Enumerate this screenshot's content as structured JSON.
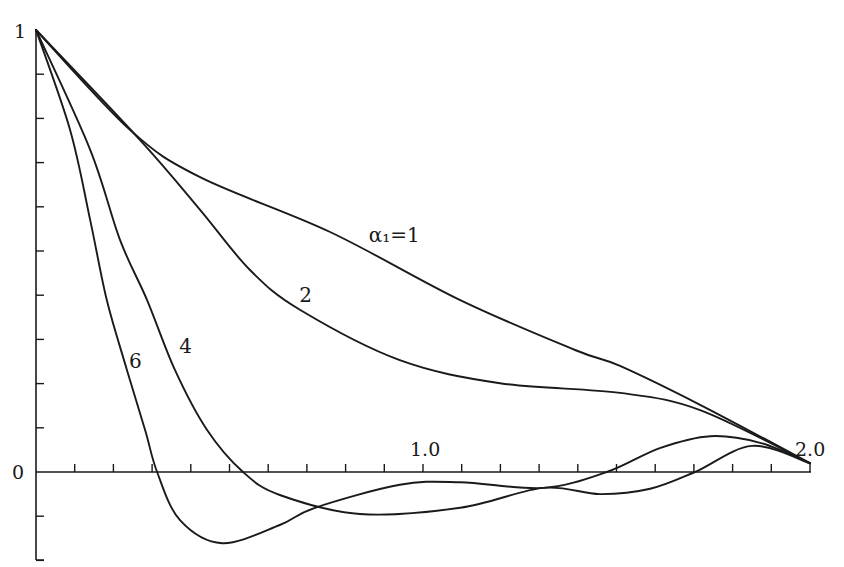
{
  "chart_data": {
    "type": "line",
    "title": "",
    "xlabel": "",
    "ylabel": "",
    "xlim": [
      0,
      2.0
    ],
    "ylim": [
      -0.2,
      1.0
    ],
    "grid": false,
    "legend": "inline curve labels",
    "x_tick_step": 0.1,
    "y_tick_step": 0.1,
    "x_tick_labels": [
      {
        "value": 1.0,
        "text": "1.0"
      },
      {
        "value": 2.0,
        "text": "2.0"
      }
    ],
    "y_tick_labels": [
      {
        "value": 1,
        "text": "1"
      },
      {
        "value": 0,
        "text": "0"
      }
    ],
    "series": [
      {
        "name": "α1=1",
        "label": "α₁=1",
        "label_pos": [
          0.86,
          0.52
        ],
        "points": [
          [
            0,
            1
          ],
          [
            0.243,
            0.774
          ],
          [
            0.424,
            0.667
          ],
          [
            0.76,
            0.543
          ],
          [
            1.096,
            0.389
          ],
          [
            1.393,
            0.276
          ],
          [
            1.509,
            0.24
          ],
          [
            1.716,
            0.152
          ],
          [
            2.0,
            0.02
          ]
        ]
      },
      {
        "name": "α1=2",
        "label": "2",
        "label_pos": [
          0.68,
          0.385
        ],
        "points": [
          [
            0,
            1
          ],
          [
            0.269,
            0.751
          ],
          [
            0.424,
            0.593
          ],
          [
            0.553,
            0.457
          ],
          [
            0.682,
            0.367
          ],
          [
            0.94,
            0.253
          ],
          [
            1.199,
            0.201
          ],
          [
            1.509,
            0.179
          ],
          [
            1.716,
            0.14
          ],
          [
            2.0,
            0.02
          ]
        ]
      },
      {
        "name": "α1=4",
        "label": "4",
        "label_pos": [
          0.37,
          0.27
        ],
        "points": [
          [
            0,
            1
          ],
          [
            0.14,
            0.729
          ],
          [
            0.217,
            0.525
          ],
          [
            0.287,
            0.389
          ],
          [
            0.359,
            0.231
          ],
          [
            0.442,
            0.095
          ],
          [
            0.535,
            0.0
          ],
          [
            0.63,
            -0.052
          ],
          [
            0.837,
            -0.095
          ],
          [
            1.096,
            -0.081
          ],
          [
            1.31,
            -0.036
          ],
          [
            1.457,
            -0.05
          ],
          [
            1.587,
            -0.038
          ],
          [
            1.703,
            0.0
          ],
          [
            1.85,
            0.059
          ],
          [
            2.0,
            0.02
          ]
        ]
      },
      {
        "name": "α1=6",
        "label": "6",
        "label_pos": [
          0.24,
          0.235
        ],
        "points": [
          [
            0,
            1
          ],
          [
            0.088,
            0.774
          ],
          [
            0.14,
            0.57
          ],
          [
            0.183,
            0.389
          ],
          [
            0.235,
            0.231
          ],
          [
            0.282,
            0.095
          ],
          [
            0.313,
            0.0
          ],
          [
            0.372,
            -0.109
          ],
          [
            0.481,
            -0.161
          ],
          [
            0.63,
            -0.12
          ],
          [
            0.721,
            -0.081
          ],
          [
            0.94,
            -0.029
          ],
          [
            1.096,
            -0.023
          ],
          [
            1.31,
            -0.036
          ],
          [
            1.475,
            0.0
          ],
          [
            1.612,
            0.054
          ],
          [
            1.742,
            0.081
          ],
          [
            1.871,
            0.066
          ],
          [
            2.0,
            0.02
          ]
        ]
      }
    ]
  },
  "axes": {
    "y_top_label": "1",
    "y_zero_label": "0",
    "x_mid_label": "1.0",
    "x_end_label": "2.0"
  }
}
